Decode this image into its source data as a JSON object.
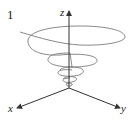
{
  "figure": {
    "label": "1",
    "axes": {
      "z_label": "z",
      "x_label": "x",
      "y_label": "y"
    },
    "colors": {
      "axis": "#333333",
      "curve": "#7a7a7a",
      "text": "#222222"
    },
    "curve_description": "conical helix (spiral) narrowing toward the origin"
  }
}
